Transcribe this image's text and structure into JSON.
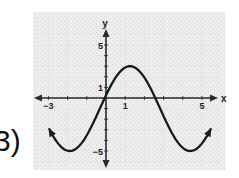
{
  "problem": {
    "label": "3)"
  },
  "chart_data": {
    "type": "line",
    "title": "",
    "xlabel": "x",
    "ylabel": "y",
    "xlim": [
      -3.2,
      5.2
    ],
    "ylim": [
      -6.2,
      6.2
    ],
    "x_tick_labels": [
      {
        "value": -3,
        "label": "−3"
      },
      {
        "value": 1,
        "label": "1"
      },
      {
        "value": 5,
        "label": "5"
      }
    ],
    "y_tick_labels": [
      {
        "value": 5,
        "label": "5"
      },
      {
        "value": 1,
        "label": "1"
      },
      {
        "value": -5,
        "label": "−5"
      }
    ],
    "x_ticks": [
      -3,
      -2,
      -1,
      0,
      1,
      2,
      3,
      4,
      5
    ],
    "y_ticks": [
      -6,
      -5,
      -4,
      -3,
      -2,
      -1,
      0,
      1,
      2,
      3,
      4,
      5,
      6
    ],
    "grid": true,
    "series": [
      {
        "name": "f(x)",
        "description": "sinusoid y = 4 sin(x + 0.32) - 1, arrows at both ends",
        "amplitude": 4,
        "midline": -1,
        "period": 6.28,
        "phase_shift": -0.32,
        "x_range": [
          -2.95,
          5.45
        ],
        "key_points": [
          {
            "x": -1.9,
            "y": -5,
            "note": "minimum"
          },
          {
            "x": 0,
            "y": 0.3
          },
          {
            "x": 1.25,
            "y": 3,
            "note": "maximum"
          },
          {
            "x": 2.57,
            "y": 0,
            "note": "x-intercept"
          },
          {
            "x": 4.4,
            "y": -5,
            "note": "minimum"
          }
        ]
      }
    ]
  }
}
